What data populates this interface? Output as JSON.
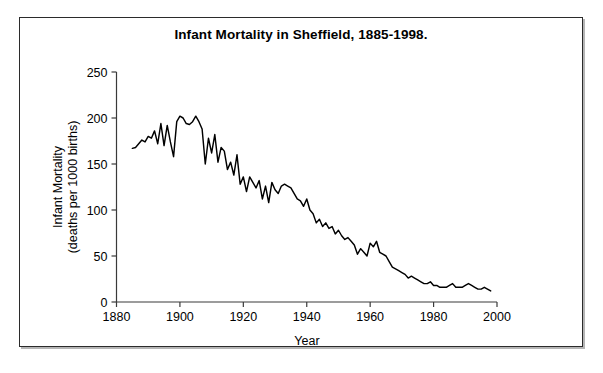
{
  "figure": {
    "title": "Infant Mortality in Sheffield, 1885-1998.",
    "border_color": "#2b2b2b",
    "background": "#ffffff"
  },
  "chart_data": {
    "type": "line",
    "title": "Infant Mortality in Sheffield, 1885-1998.",
    "xlabel": "Year",
    "ylabel": "Infant Mortality\n(deaths per 1000 births)",
    "ylabel_line1": "Infant Mortality",
    "ylabel_line2": "(deaths per 1000 births)",
    "xlim": [
      1880,
      2000
    ],
    "ylim": [
      0,
      250
    ],
    "xticks": [
      1880,
      1900,
      1920,
      1940,
      1960,
      1980,
      2000
    ],
    "xtick_labels": [
      "1880",
      "1900",
      "1920",
      "1940",
      "1960",
      "1980",
      "2000"
    ],
    "yticks": [
      0,
      50,
      100,
      150,
      200,
      250
    ],
    "ytick_labels": [
      "0",
      "50",
      "100",
      "150",
      "200",
      "250"
    ],
    "grid": false,
    "legend": null,
    "line_color": "#000000",
    "series": [
      {
        "name": "Infant Mortality",
        "x": [
          1885,
          1886,
          1887,
          1888,
          1889,
          1890,
          1891,
          1892,
          1893,
          1894,
          1895,
          1896,
          1897,
          1898,
          1899,
          1900,
          1901,
          1902,
          1903,
          1904,
          1905,
          1906,
          1907,
          1908,
          1909,
          1910,
          1911,
          1912,
          1913,
          1914,
          1915,
          1916,
          1917,
          1918,
          1919,
          1920,
          1921,
          1922,
          1923,
          1924,
          1925,
          1926,
          1927,
          1928,
          1929,
          1930,
          1931,
          1932,
          1933,
          1934,
          1935,
          1936,
          1937,
          1938,
          1939,
          1940,
          1941,
          1942,
          1943,
          1944,
          1945,
          1946,
          1947,
          1948,
          1949,
          1950,
          1951,
          1952,
          1953,
          1954,
          1955,
          1956,
          1957,
          1958,
          1959,
          1960,
          1961,
          1962,
          1963,
          1964,
          1965,
          1966,
          1967,
          1968,
          1969,
          1970,
          1971,
          1972,
          1973,
          1974,
          1975,
          1976,
          1977,
          1978,
          1979,
          1980,
          1981,
          1982,
          1983,
          1984,
          1985,
          1986,
          1987,
          1988,
          1989,
          1990,
          1991,
          1992,
          1993,
          1994,
          1995,
          1996,
          1997,
          1998
        ],
        "values": [
          167,
          168,
          172,
          176,
          174,
          180,
          178,
          186,
          172,
          194,
          170,
          192,
          174,
          158,
          196,
          202,
          200,
          194,
          193,
          196,
          202,
          196,
          188,
          150,
          178,
          162,
          182,
          152,
          168,
          164,
          144,
          152,
          138,
          160,
          128,
          136,
          120,
          136,
          130,
          124,
          132,
          112,
          126,
          108,
          130,
          122,
          118,
          126,
          128,
          126,
          124,
          118,
          112,
          110,
          104,
          112,
          100,
          96,
          86,
          90,
          82,
          86,
          80,
          82,
          74,
          78,
          72,
          68,
          70,
          66,
          62,
          52,
          58,
          54,
          50,
          64,
          60,
          66,
          54,
          52,
          50,
          44,
          38,
          36,
          34,
          32,
          30,
          26,
          28,
          26,
          24,
          22,
          20,
          20,
          22,
          18,
          18,
          16,
          16,
          16,
          18,
          20,
          16,
          16,
          16,
          18,
          20,
          18,
          16,
          14,
          14,
          16,
          14,
          12
        ]
      }
    ]
  },
  "axes": {
    "x_title": "Year",
    "y_title_line1": "Infant Mortality",
    "y_title_line2": "(deaths per 1000 births)"
  }
}
